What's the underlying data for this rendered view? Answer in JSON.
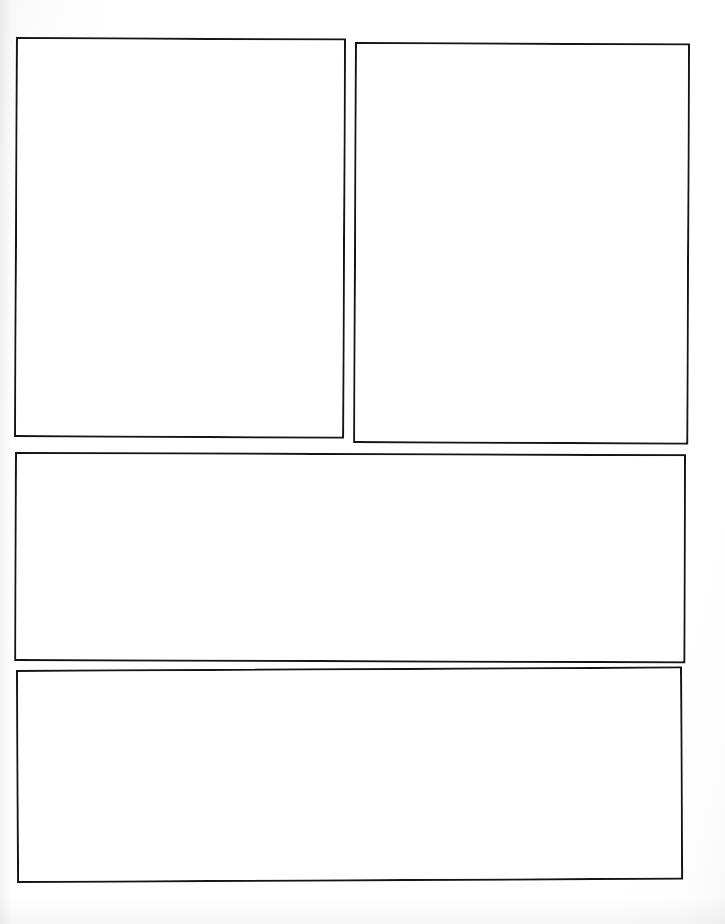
{
  "document": {
    "kind": "blank-panel-template",
    "description": "Scanned blank page with four empty ruled panels",
    "page_width": 725,
    "page_height": 924,
    "background_color": "#ffffff",
    "border_color": "#141414",
    "panel_fill_color": "#ffffff",
    "border_width_px": 2,
    "panel_count": 4
  },
  "panels": [
    {
      "id": "panel-1",
      "label": "",
      "content": "",
      "row": 1,
      "column": 1,
      "x": 16,
      "y": 37,
      "width": 330,
      "height": 400
    },
    {
      "id": "panel-2",
      "label": "",
      "content": "",
      "row": 1,
      "column": 2,
      "x": 355,
      "y": 42,
      "width": 335,
      "height": 401
    },
    {
      "id": "panel-3",
      "label": "",
      "content": "",
      "row": 2,
      "column": 1,
      "x": 15,
      "y": 452,
      "width": 671,
      "height": 209
    },
    {
      "id": "panel-4",
      "label": "",
      "content": "",
      "row": 3,
      "column": 1,
      "x": 16,
      "y": 670,
      "width": 666,
      "height": 213
    }
  ]
}
